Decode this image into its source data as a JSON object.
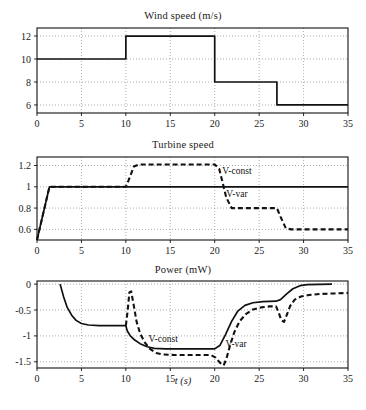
{
  "figure": {
    "xlabel": "t (s)",
    "panels": [
      "wind",
      "turbine",
      "power"
    ]
  },
  "chart_data": [
    {
      "type": "line",
      "title": "Wind speed (m/s)",
      "xlabel": "",
      "ylabel": "",
      "xlim": [
        0,
        35
      ],
      "ylim": [
        5.3,
        12.7
      ],
      "xticks": [
        0,
        5,
        10,
        15,
        20,
        25,
        30,
        35
      ],
      "yticks": [
        6,
        8,
        10,
        12
      ],
      "grid": true,
      "legend": null,
      "series": [
        {
          "name": "wind-speed",
          "style": "solid",
          "steps": [
            {
              "t_start": 0,
              "t_end": 10,
              "value": 10
            },
            {
              "t_start": 10,
              "t_end": 20,
              "value": 12
            },
            {
              "t_start": 20,
              "t_end": 27,
              "value": 8
            },
            {
              "t_start": 27,
              "t_end": 35,
              "value": 6
            }
          ],
          "points": [
            [
              0,
              10
            ],
            [
              10,
              10
            ],
            [
              10,
              12
            ],
            [
              20,
              12
            ],
            [
              20,
              8
            ],
            [
              27,
              8
            ],
            [
              27,
              6
            ],
            [
              35,
              6
            ]
          ]
        }
      ]
    },
    {
      "type": "line",
      "title": "Turbine speed",
      "xlabel": "",
      "ylabel": "",
      "xlim": [
        0,
        35
      ],
      "ylim": [
        0.5,
        1.28
      ],
      "xticks": [
        0,
        5,
        10,
        15,
        20,
        25,
        30,
        35
      ],
      "yticks": [
        0.6,
        0.8,
        1,
        1.2
      ],
      "grid": true,
      "legend": {
        "position": "inline",
        "entries": [
          "V-const",
          "V-var"
        ]
      },
      "series": [
        {
          "name": "V-const",
          "style": "solid",
          "label": "V-const",
          "label_at": [
            22.5,
            1.12
          ],
          "points": [
            [
              0,
              0.5
            ],
            [
              1.4,
              1.0
            ],
            [
              35,
              1.0
            ]
          ]
        },
        {
          "name": "V-var",
          "style": "dashed",
          "label": "V-var",
          "label_at": [
            22.5,
            0.9
          ],
          "points": [
            [
              0,
              0.5
            ],
            [
              1.4,
              1.0
            ],
            [
              10,
              1.0
            ],
            [
              10.3,
              1.06
            ],
            [
              10.9,
              1.19
            ],
            [
              11.5,
              1.21
            ],
            [
              20,
              1.21
            ],
            [
              20.5,
              1.17
            ],
            [
              21.3,
              0.9
            ],
            [
              21.9,
              0.8
            ],
            [
              27,
              0.8
            ],
            [
              27.4,
              0.72
            ],
            [
              28,
              0.61
            ],
            [
              28.6,
              0.6
            ],
            [
              35,
              0.6
            ]
          ]
        }
      ]
    },
    {
      "type": "line",
      "title": "Power (mW)",
      "xlabel": "t (s)",
      "ylabel": "",
      "xlim": [
        0,
        35
      ],
      "ylim": [
        -1.62,
        0.06
      ],
      "xticks": [
        0,
        5,
        10,
        15,
        20,
        25,
        30,
        35
      ],
      "yticks": [
        0,
        -0.5,
        -1,
        -1.5
      ],
      "grid": true,
      "legend": {
        "position": "inline",
        "entries": [
          "V-const",
          "V-var"
        ]
      },
      "series": [
        {
          "name": "V-const",
          "style": "solid",
          "label": "V-const",
          "label_at": [
            14.2,
            -1.12
          ],
          "points": [
            [
              2.6,
              0.0
            ],
            [
              3.0,
              -0.25
            ],
            [
              3.4,
              -0.45
            ],
            [
              3.9,
              -0.6
            ],
            [
              4.4,
              -0.7
            ],
            [
              5.0,
              -0.76
            ],
            [
              5.8,
              -0.79
            ],
            [
              7.0,
              -0.8
            ],
            [
              10,
              -0.8
            ],
            [
              10.15,
              -0.9
            ],
            [
              10.5,
              -1.0
            ],
            [
              11.0,
              -1.08
            ],
            [
              11.6,
              -1.15
            ],
            [
              12.4,
              -1.21
            ],
            [
              13.2,
              -1.24
            ],
            [
              14.5,
              -1.25
            ],
            [
              20,
              -1.25
            ],
            [
              20.6,
              -1.18
            ],
            [
              21.2,
              -0.98
            ],
            [
              21.9,
              -0.72
            ],
            [
              22.6,
              -0.52
            ],
            [
              23.4,
              -0.41
            ],
            [
              24.3,
              -0.36
            ],
            [
              25.4,
              -0.34
            ],
            [
              26.9,
              -0.33
            ],
            [
              27.4,
              -0.3
            ],
            [
              28.1,
              -0.19
            ],
            [
              28.8,
              -0.09
            ],
            [
              29.6,
              -0.03
            ],
            [
              30.4,
              -0.01
            ],
            [
              33.2,
              0.0
            ]
          ]
        },
        {
          "name": "V-var",
          "style": "dashed",
          "label": "V-var",
          "label_at": [
            22.4,
            -1.22
          ],
          "points": [
            [
              10,
              -0.8
            ],
            [
              10.2,
              -0.52
            ],
            [
              10.4,
              -0.16
            ],
            [
              10.6,
              -0.14
            ],
            [
              10.9,
              -0.42
            ],
            [
              11.2,
              -0.72
            ],
            [
              11.6,
              -0.95
            ],
            [
              12.1,
              -1.12
            ],
            [
              12.7,
              -1.25
            ],
            [
              13.4,
              -1.33
            ],
            [
              14.2,
              -1.36
            ],
            [
              15.5,
              -1.37
            ],
            [
              19.6,
              -1.37
            ],
            [
              20.1,
              -1.42
            ],
            [
              20.6,
              -1.52
            ],
            [
              21.0,
              -1.57
            ],
            [
              21.3,
              -1.45
            ],
            [
              21.7,
              -1.2
            ],
            [
              22.2,
              -0.93
            ],
            [
              22.8,
              -0.72
            ],
            [
              23.5,
              -0.58
            ],
            [
              24.3,
              -0.49
            ],
            [
              25.2,
              -0.45
            ],
            [
              26.2,
              -0.43
            ],
            [
              26.9,
              -0.43
            ],
            [
              27.2,
              -0.55
            ],
            [
              27.5,
              -0.7
            ],
            [
              27.8,
              -0.73
            ],
            [
              28.1,
              -0.6
            ],
            [
              28.5,
              -0.42
            ],
            [
              29.0,
              -0.3
            ],
            [
              29.7,
              -0.24
            ],
            [
              30.6,
              -0.21
            ],
            [
              31.8,
              -0.19
            ],
            [
              33.5,
              -0.18
            ],
            [
              35,
              -0.17
            ]
          ]
        }
      ]
    }
  ]
}
